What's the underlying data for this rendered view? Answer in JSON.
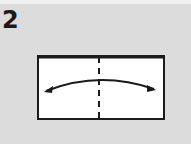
{
  "step": {
    "number": "2"
  },
  "diagram": {
    "shape": "rectangle",
    "fold_line": "valley-fold-dashed-vertical-center",
    "arrow": "double-headed-curved-arrow",
    "colors": {
      "background": "#dcdcdc",
      "paper": "#ffffff",
      "line": "#1a1a1a"
    }
  }
}
